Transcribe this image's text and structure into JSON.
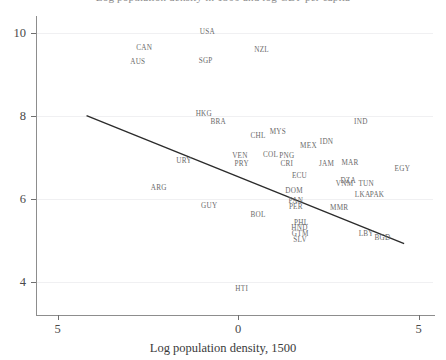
{
  "chart_data": {
    "type": "scatter",
    "title": "Log population density in 1500 and log GDP per capita",
    "xlabel": "Log population density, 1500",
    "ylabel": "",
    "xlim": [
      -5.6,
      5.4
    ],
    "ylim": [
      3.3,
      10.4
    ],
    "xticks": [
      "5",
      "0",
      "5"
    ],
    "xtick_values": [
      -5,
      0,
      5
    ],
    "yticks": [
      "10",
      "8",
      "6",
      "4"
    ],
    "ytick_values": [
      10,
      8,
      6,
      4
    ],
    "grid": true,
    "legend": "none",
    "marker_style": "text-label",
    "points": [
      {
        "label": "USA",
        "x": -0.85,
        "y": 10.02
      },
      {
        "label": "CAN",
        "x": -2.6,
        "y": 9.62
      },
      {
        "label": "NZL",
        "x": 0.65,
        "y": 9.58
      },
      {
        "label": "AUS",
        "x": -2.78,
        "y": 9.3
      },
      {
        "label": "SGP",
        "x": -0.9,
        "y": 9.31
      },
      {
        "label": "HKG",
        "x": -0.95,
        "y": 8.04
      },
      {
        "label": "BRA",
        "x": -0.55,
        "y": 7.84
      },
      {
        "label": "IND",
        "x": 3.4,
        "y": 7.86
      },
      {
        "label": "MYS",
        "x": 1.1,
        "y": 7.62
      },
      {
        "label": "CHL",
        "x": 0.55,
        "y": 7.5
      },
      {
        "label": "MEX",
        "x": 1.95,
        "y": 7.28
      },
      {
        "label": "IDN",
        "x": 2.45,
        "y": 7.37
      },
      {
        "label": "COL",
        "x": 0.9,
        "y": 7.06
      },
      {
        "label": "PNG",
        "x": 1.35,
        "y": 7.03
      },
      {
        "label": "VEN",
        "x": 0.05,
        "y": 7.02
      },
      {
        "label": "CRI",
        "x": 1.35,
        "y": 6.85
      },
      {
        "label": "JAM",
        "x": 2.45,
        "y": 6.85
      },
      {
        "label": "MAR",
        "x": 3.1,
        "y": 6.86
      },
      {
        "label": "PRY",
        "x": 0.1,
        "y": 6.83
      },
      {
        "label": "URY",
        "x": -1.5,
        "y": 6.9
      },
      {
        "label": "EGY",
        "x": 4.55,
        "y": 6.72
      },
      {
        "label": "ECU",
        "x": 1.7,
        "y": 6.55
      },
      {
        "label": "DZA",
        "x": 3.05,
        "y": 6.42
      },
      {
        "label": "VNM",
        "x": 2.95,
        "y": 6.35
      },
      {
        "label": "TUN",
        "x": 3.55,
        "y": 6.36
      },
      {
        "label": "ARG",
        "x": -2.2,
        "y": 6.25
      },
      {
        "label": "DOM",
        "x": 1.55,
        "y": 6.2
      },
      {
        "label": "LKA",
        "x": 3.45,
        "y": 6.08
      },
      {
        "label": "PAK",
        "x": 3.85,
        "y": 6.08
      },
      {
        "label": "PAN",
        "x": 1.6,
        "y": 5.94
      },
      {
        "label": "PER",
        "x": 1.6,
        "y": 5.8
      },
      {
        "label": "GUY",
        "x": -0.8,
        "y": 5.82
      },
      {
        "label": "MMR",
        "x": 2.8,
        "y": 5.78
      },
      {
        "label": "BOL",
        "x": 0.55,
        "y": 5.62
      },
      {
        "label": "PHL",
        "x": 1.75,
        "y": 5.43
      },
      {
        "label": "HND",
        "x": 1.7,
        "y": 5.29
      },
      {
        "label": "LBY",
        "x": 3.55,
        "y": 5.16
      },
      {
        "label": "GTM",
        "x": 1.72,
        "y": 5.16
      },
      {
        "label": "BGD",
        "x": 4.0,
        "y": 5.06
      },
      {
        "label": "SLV",
        "x": 1.72,
        "y": 5.02
      },
      {
        "label": "HTI",
        "x": 0.1,
        "y": 3.82
      }
    ],
    "fit_line": {
      "type": "linear",
      "x_start": -4.2,
      "y_start": 8.0,
      "x_end": 4.6,
      "y_end": 4.92,
      "color": "#2b2b2b"
    }
  },
  "style": {
    "background": "#ffffff",
    "axis_color": "#8d8d8d",
    "grid_color": "#f0f0f2",
    "label_color": "#6a6a6a"
  }
}
